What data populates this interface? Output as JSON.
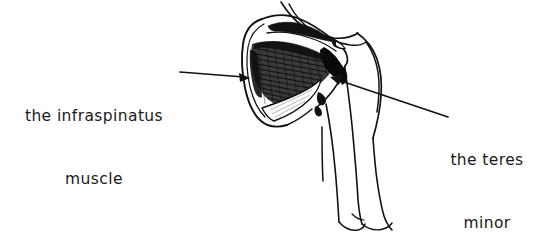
{
  "figure": {
    "style": "hand-drawn ink line art",
    "background_color": "#ffffff",
    "ink_color": "#111111"
  },
  "labels": [
    {
      "id": "infraspinatus",
      "line1": "the infraspinatus",
      "line2": "muscle",
      "position": "left",
      "align": "center"
    },
    {
      "id": "teres-minor",
      "line1": "the teres",
      "line2": "minor",
      "position": "right",
      "align": "center"
    }
  ],
  "annotations": {
    "leader_infraspinatus": {
      "name": "arrow pointing right into infraspinatus fossa",
      "from": [
        180,
        72
      ],
      "to": [
        250,
        78
      ],
      "arrowhead": "right"
    },
    "leader_teres_minor": {
      "name": "arrow pointing up-left into teres minor",
      "from": [
        448,
        117
      ],
      "to": [
        331,
        77
      ],
      "arrowhead": "up-left"
    }
  },
  "structures": [
    {
      "name": "scapula",
      "shading": "outline"
    },
    {
      "name": "spine-of-scapula",
      "shading": "dark hatch"
    },
    {
      "name": "infraspinatus",
      "shading": "dense diagonal hatch"
    },
    {
      "name": "teres-minor",
      "shading": "solid black wedge"
    },
    {
      "name": "teres-major",
      "shading": "light outline band"
    },
    {
      "name": "humerus-and-arm",
      "shading": "contour lines"
    },
    {
      "name": "neck-trapezius-contour",
      "shading": "contour line"
    }
  ]
}
